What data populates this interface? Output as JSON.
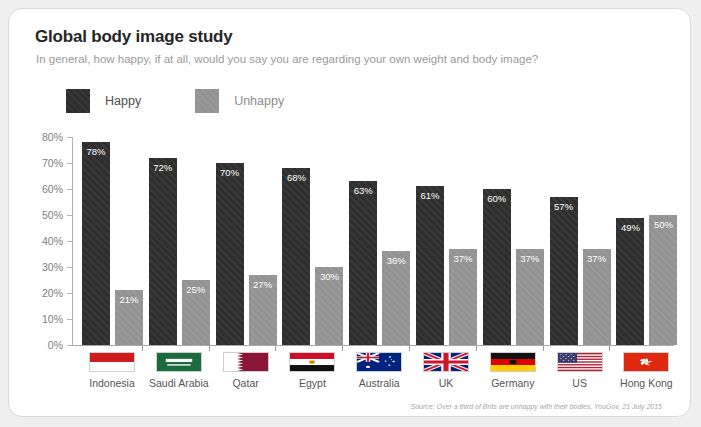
{
  "card": {
    "title": "Global body image study",
    "subtitle": "In general, how happy, if at all, would you say you are regarding your own weight and body image?",
    "source": "Source: Over a third of Brits are unhappy with their bodies, YouGov, 21 July 2015"
  },
  "legend": [
    {
      "label": "Happy",
      "color": "#2e2e2e",
      "key": "happy"
    },
    {
      "label": "Unhappy",
      "color": "#939393",
      "key": "unhappy"
    }
  ],
  "chart_data": {
    "type": "bar",
    "title": "Global body image study",
    "subtitle": "In general, how happy, if at all, would you say you are regarding your own weight and body image?",
    "xlabel": "",
    "ylabel": "",
    "ylim": [
      0,
      80
    ],
    "ytick_labels": [
      "0%",
      "10%",
      "20%",
      "30%",
      "40%",
      "50%",
      "60%",
      "70%",
      "80%"
    ],
    "ytick_values": [
      0,
      10,
      20,
      30,
      40,
      50,
      60,
      70,
      80
    ],
    "grid": false,
    "legend_position": "top-left",
    "categories": [
      "Indonesia",
      "Saudi Arabia",
      "Qatar",
      "Egypt",
      "Australia",
      "UK",
      "Germany",
      "US",
      "Hong Kong"
    ],
    "series": [
      {
        "name": "Happy",
        "color": "#2e2e2e",
        "values": [
          78,
          72,
          70,
          68,
          63,
          61,
          60,
          57,
          49
        ],
        "labels": [
          "78%",
          "72%",
          "70%",
          "68%",
          "63%",
          "61%",
          "60%",
          "57%",
          "49%"
        ]
      },
      {
        "name": "Unhappy",
        "color": "#939393",
        "values": [
          21,
          25,
          27,
          30,
          36,
          37,
          37,
          37,
          50
        ],
        "labels": [
          "21%",
          "25%",
          "27%",
          "30%",
          "36%",
          "37%",
          "37%",
          "37%",
          "50%"
        ]
      }
    ],
    "flags": [
      "flag-indonesia",
      "flag-saudi-arabia",
      "flag-qatar",
      "flag-egypt",
      "flag-australia",
      "flag-uk",
      "flag-germany",
      "flag-us",
      "flag-hong-kong"
    ]
  }
}
